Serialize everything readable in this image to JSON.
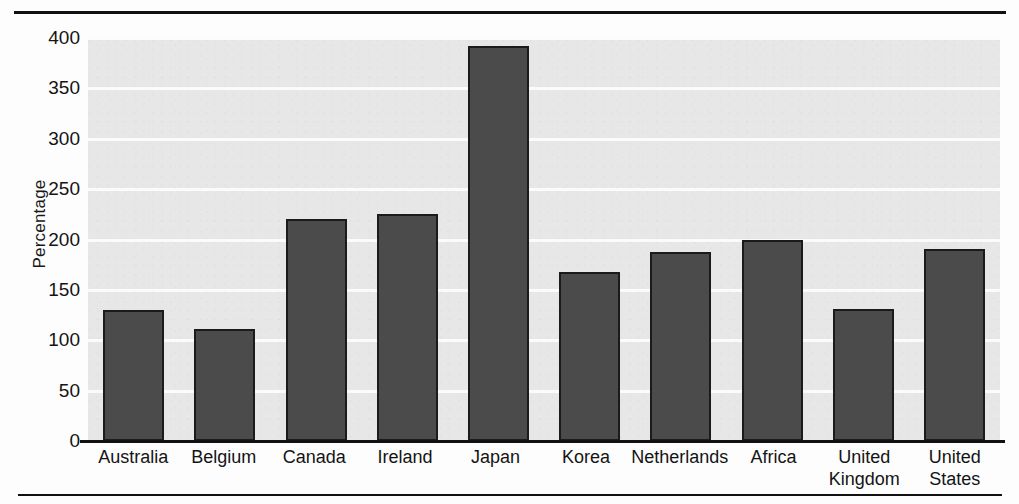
{
  "chart_data": {
    "type": "bar",
    "title": "",
    "subtitle": "",
    "xlabel": "",
    "ylabel": "Percentage",
    "ylim": [
      0,
      400
    ],
    "grid": true,
    "legend": "none",
    "yticks": [
      0,
      50,
      100,
      150,
      200,
      250,
      300,
      350,
      400
    ],
    "categories": [
      "Australia",
      "Belgium",
      "Canada",
      "Ireland",
      "Japan",
      "Korea",
      "Netherlands",
      "Africa",
      "United Kingdom",
      "United States"
    ],
    "category_lines": [
      [
        "Australia"
      ],
      [
        "Belgium"
      ],
      [
        "Canada"
      ],
      [
        "Ireland"
      ],
      [
        "Japan"
      ],
      [
        "Korea"
      ],
      [
        "Netherlands"
      ],
      [
        "Africa"
      ],
      [
        "United",
        "Kingdom"
      ],
      [
        "United",
        "States"
      ]
    ],
    "values": [
      130,
      111,
      220,
      225,
      392,
      168,
      188,
      200,
      131,
      191
    ],
    "bar_color": "#4b4b4b",
    "bar_edge_color": "#1b1b1b",
    "plot_background": "#e7e7e7",
    "gridline_color": "#fbfbfb",
    "axis_color": "#111111"
  }
}
